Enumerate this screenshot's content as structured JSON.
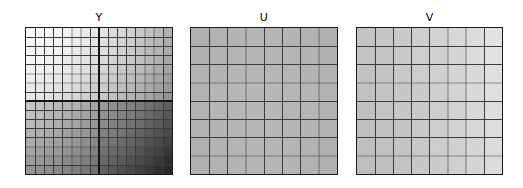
{
  "figure": {
    "background_color": "#ffffff",
    "grid_line_color": "#3c3c3c",
    "block_border_color": "#1a1a1a",
    "panel_count": 3
  },
  "panels": [
    {
      "title": "Y",
      "name": "y-component-block",
      "grid_rows": 16,
      "grid_cols": 16,
      "sub_block_rows": 2,
      "sub_block_cols": 2,
      "thick_divider": true,
      "description": "luma plane, diagonal gradient bright top-left to dark bottom-right"
    },
    {
      "title": "U",
      "name": "u-component-block",
      "grid_rows": 8,
      "grid_cols": 8,
      "sub_block_rows": 1,
      "sub_block_cols": 1,
      "thick_divider": false,
      "description": "chroma-blue plane, near uniform mid grey"
    },
    {
      "title": "V",
      "name": "v-component-block",
      "grid_rows": 8,
      "grid_cols": 8,
      "sub_block_rows": 1,
      "sub_block_cols": 1,
      "thick_divider": false,
      "description": "chroma-red plane, light grey brightening toward right"
    }
  ],
  "chart_data": {
    "type": "heatmap",
    "title": "",
    "subtitle": "",
    "xlabel": "",
    "ylabel": "",
    "grid": true,
    "legend": "none",
    "colormap": "gray",
    "value_range": [
      0,
      255
    ],
    "panels": [
      {
        "name": "Y",
        "shape": [
          16,
          16
        ],
        "values": [
          [
            252,
            250,
            248,
            245,
            242,
            238,
            234,
            230,
            226,
            220,
            214,
            207,
            200,
            192,
            184,
            176
          ],
          [
            250,
            248,
            246,
            243,
            240,
            236,
            232,
            228,
            223,
            217,
            211,
            204,
            197,
            189,
            181,
            173
          ],
          [
            248,
            246,
            244,
            241,
            238,
            234,
            230,
            225,
            220,
            214,
            208,
            201,
            194,
            186,
            178,
            170
          ],
          [
            245,
            243,
            241,
            238,
            235,
            231,
            227,
            222,
            217,
            211,
            205,
            198,
            191,
            183,
            175,
            167
          ],
          [
            242,
            240,
            238,
            235,
            232,
            228,
            223,
            218,
            213,
            207,
            201,
            194,
            187,
            179,
            171,
            163
          ],
          [
            238,
            236,
            234,
            231,
            228,
            223,
            218,
            213,
            208,
            202,
            196,
            189,
            182,
            174,
            166,
            158
          ],
          [
            234,
            232,
            230,
            227,
            223,
            218,
            213,
            208,
            203,
            197,
            191,
            184,
            177,
            169,
            161,
            153
          ],
          [
            230,
            228,
            225,
            222,
            218,
            213,
            208,
            203,
            198,
            192,
            186,
            179,
            172,
            164,
            156,
            148
          ],
          [
            198,
            194,
            190,
            186,
            181,
            176,
            170,
            164,
            152,
            145,
            138,
            130,
            122,
            113,
            104,
            95
          ],
          [
            192,
            188,
            184,
            180,
            175,
            170,
            164,
            158,
            145,
            138,
            131,
            123,
            115,
            106,
            97,
            88
          ],
          [
            186,
            182,
            178,
            174,
            169,
            163,
            157,
            151,
            138,
            131,
            124,
            116,
            108,
            99,
            90,
            81
          ],
          [
            179,
            175,
            171,
            167,
            162,
            156,
            150,
            144,
            130,
            123,
            116,
            108,
            100,
            91,
            82,
            73
          ],
          [
            172,
            168,
            164,
            160,
            155,
            149,
            143,
            137,
            122,
            115,
            108,
            100,
            92,
            83,
            74,
            64
          ],
          [
            164,
            160,
            156,
            152,
            147,
            141,
            135,
            129,
            113,
            106,
            99,
            91,
            83,
            74,
            65,
            55
          ],
          [
            156,
            152,
            148,
            144,
            139,
            133,
            127,
            121,
            104,
            97,
            90,
            82,
            74,
            65,
            56,
            46
          ],
          [
            148,
            144,
            140,
            136,
            131,
            125,
            119,
            113,
            95,
            88,
            81,
            73,
            65,
            56,
            47,
            37
          ]
        ]
      },
      {
        "name": "U",
        "shape": [
          8,
          8
        ],
        "values": [
          [
            176,
            178,
            180,
            181,
            181,
            180,
            178,
            176
          ],
          [
            177,
            179,
            181,
            182,
            182,
            181,
            179,
            177
          ],
          [
            178,
            180,
            182,
            183,
            183,
            182,
            180,
            178
          ],
          [
            178,
            181,
            183,
            184,
            184,
            183,
            181,
            178
          ],
          [
            178,
            181,
            183,
            184,
            184,
            183,
            181,
            178
          ],
          [
            178,
            180,
            182,
            183,
            183,
            182,
            180,
            178
          ],
          [
            177,
            179,
            181,
            182,
            182,
            181,
            179,
            177
          ],
          [
            176,
            178,
            180,
            181,
            181,
            180,
            178,
            176
          ]
        ]
      },
      {
        "name": "V",
        "shape": [
          8,
          8
        ],
        "values": [
          [
            196,
            199,
            202,
            206,
            210,
            215,
            220,
            226
          ],
          [
            195,
            198,
            201,
            205,
            209,
            214,
            219,
            225
          ],
          [
            194,
            197,
            200,
            204,
            208,
            213,
            218,
            224
          ],
          [
            193,
            196,
            199,
            203,
            207,
            212,
            217,
            223
          ],
          [
            192,
            195,
            198,
            202,
            206,
            211,
            216,
            222
          ],
          [
            191,
            194,
            197,
            201,
            205,
            210,
            215,
            221
          ],
          [
            190,
            193,
            196,
            200,
            204,
            209,
            214,
            220
          ],
          [
            189,
            192,
            195,
            199,
            203,
            208,
            213,
            219
          ]
        ]
      }
    ]
  }
}
